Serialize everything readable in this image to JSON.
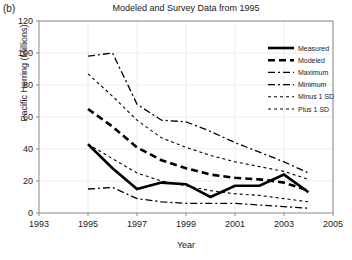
{
  "panel_label": "(b)",
  "chart_data": {
    "type": "line",
    "title": "Modeled and Survey Data from 1995",
    "xlabel": "Year",
    "ylabel": "Pacific Herring (Millions)",
    "xlim": [
      1993,
      2005
    ],
    "ylim": [
      0,
      120
    ],
    "xticks": [
      1993,
      1995,
      1997,
      1999,
      2001,
      2003,
      2005
    ],
    "yticks": [
      0,
      20,
      40,
      60,
      80,
      100,
      120
    ],
    "grid": true,
    "legend_position": "top-right",
    "x": [
      1995,
      1996,
      1997,
      1998,
      1999,
      2000,
      2001,
      2002,
      2003,
      2004
    ],
    "series": [
      {
        "name": "Measured",
        "style": "solid",
        "width": 2.6,
        "dash": "none",
        "values": [
          43,
          28,
          15,
          19,
          18,
          10,
          17,
          17,
          24,
          13
        ]
      },
      {
        "name": "Modeled",
        "style": "thick-dashed",
        "width": 2.6,
        "dash": "7,4",
        "values": [
          65,
          54,
          41,
          33,
          28,
          24,
          22,
          21,
          19,
          14
        ]
      },
      {
        "name": "Maximum",
        "style": "dash-dot",
        "width": 1.3,
        "dash": "7,3,2,3",
        "values": [
          98,
          100,
          68,
          58,
          57,
          51,
          44,
          38,
          32,
          25
        ]
      },
      {
        "name": "Minimum",
        "style": "dash-dot",
        "width": 1.3,
        "dash": "7,3,2,3",
        "values": [
          15,
          16,
          9,
          7,
          6,
          6,
          6,
          5,
          4,
          3
        ]
      },
      {
        "name": "Minus 1 SD",
        "style": "fine-dashed",
        "width": 1.1,
        "dash": "3,3",
        "values": [
          43,
          34,
          25,
          20,
          17,
          14,
          12,
          11,
          9,
          7
        ]
      },
      {
        "name": "Plus 1 SD",
        "style": "fine-dashed",
        "width": 1.1,
        "dash": "3,3",
        "values": [
          87,
          73,
          58,
          47,
          41,
          36,
          32,
          29,
          26,
          21
        ]
      }
    ]
  },
  "legend": {
    "entries": [
      {
        "label": "Measured"
      },
      {
        "label": "Modeled"
      },
      {
        "label": "Maximum"
      },
      {
        "label": "Minimum"
      },
      {
        "label": "Minus 1 SD"
      },
      {
        "label": "Plus 1 SD"
      }
    ]
  },
  "colors": {
    "line": "#000000",
    "axis": "#8a8a8a",
    "grid": "#ebebeb",
    "text": "#1a1a1a",
    "background": "#ffffff"
  }
}
